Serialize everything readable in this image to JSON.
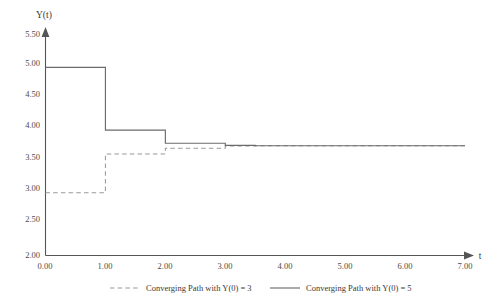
{
  "chart_data": {
    "type": "line",
    "title": "",
    "subtitle": "",
    "xlabel": "t",
    "ylabel": "Y(t)",
    "xlim": [
      0.0,
      7.0
    ],
    "ylim": [
      2.0,
      5.5
    ],
    "grid": false,
    "legend_position": "bottom",
    "x_ticks": [
      "0.00",
      "1.00",
      "2.00",
      "3.00",
      "4.00",
      "5.00",
      "6.00",
      "7.00"
    ],
    "x_tick_values": [
      0,
      1,
      2,
      3,
      4,
      5,
      6,
      7
    ],
    "y_ticks": [
      "2.00",
      "2.50",
      "3.00",
      "3.50",
      "4.00",
      "4.50",
      "5.00",
      "5.50"
    ],
    "y_tick_values": [
      2.0,
      2.5,
      3.0,
      3.5,
      4.0,
      4.5,
      5.0,
      5.5
    ],
    "interpolation": "step-post",
    "series": [
      {
        "name": "Converging Path with Y(0) = 3",
        "style": "dashed",
        "color": "#9a9a9a",
        "x": [
          0.0,
          1.0,
          2.0,
          3.0,
          3.5,
          4.0,
          5.0,
          6.0,
          7.0
        ],
        "values": [
          3.0,
          3.62,
          3.71,
          3.745,
          3.75,
          3.75,
          3.75,
          3.75,
          3.75
        ]
      },
      {
        "name": "Converging Path with Y(0) = 5",
        "style": "solid",
        "color": "#6b6b6b",
        "x": [
          0.0,
          1.0,
          2.0,
          3.0,
          3.5,
          4.0,
          5.0,
          6.0,
          7.0
        ],
        "values": [
          5.0,
          4.0,
          3.79,
          3.757,
          3.75,
          3.75,
          3.75,
          3.75,
          3.75
        ]
      }
    ],
    "converged_value": 3.75
  },
  "legend": {
    "entries": [
      {
        "label": "Converging Path with Y(0) = 3",
        "style": "dashed"
      },
      {
        "label": "Converging Path with Y(0) = 5",
        "style": "solid"
      }
    ]
  }
}
